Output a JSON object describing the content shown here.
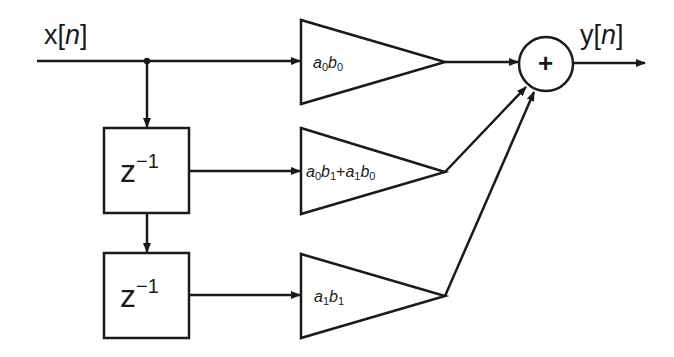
{
  "diagram": {
    "type": "block-diagram",
    "input": {
      "label_prefix": "x[",
      "label_var": "n",
      "label_suffix": "]"
    },
    "output": {
      "label_prefix": "y[",
      "label_var": "n",
      "label_suffix": "]"
    },
    "delays": [
      {
        "base": "z",
        "exp": "−1"
      },
      {
        "base": "z",
        "exp": "−1"
      }
    ],
    "gains": [
      {
        "parts": [
          {
            "v": "a",
            "s": "0"
          },
          {
            "v": "b",
            "s": "0"
          }
        ],
        "text": "a0b0"
      },
      {
        "parts": [
          {
            "v": "a",
            "s": "0"
          },
          {
            "v": "b",
            "s": "1"
          },
          {
            "op": "+"
          },
          {
            "v": "a",
            "s": "1"
          },
          {
            "v": "b",
            "s": "0"
          }
        ],
        "text": "a0b1+a1b0"
      },
      {
        "parts": [
          {
            "v": "a",
            "s": "1"
          },
          {
            "v": "b",
            "s": "1"
          }
        ],
        "text": "a1b1"
      }
    ],
    "summer": {
      "symbol": "+"
    },
    "colors": {
      "stroke": "#1a1a1a",
      "background": "#ffffff"
    }
  }
}
